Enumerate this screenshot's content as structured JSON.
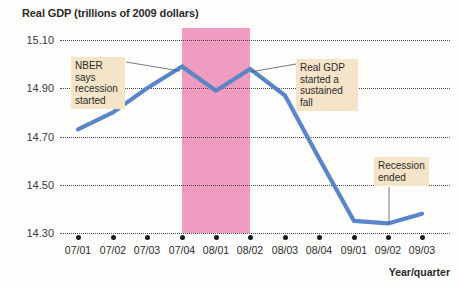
{
  "chart_data": {
    "type": "line",
    "title": "Real GDP (trillions of 2009 dollars)",
    "xlabel": "Year/quarter",
    "ylabel": "",
    "categories": [
      "07/01",
      "07/02",
      "07/03",
      "07/04",
      "08/01",
      "08/02",
      "08/03",
      "08/04",
      "09/01",
      "09/02",
      "09/03"
    ],
    "values": [
      14.73,
      14.8,
      14.9,
      14.99,
      14.89,
      14.98,
      14.87,
      14.61,
      14.35,
      14.34,
      14.38
    ],
    "series": [
      {
        "name": "Real GDP",
        "values": [
          14.73,
          14.8,
          14.9,
          14.99,
          14.89,
          14.98,
          14.87,
          14.61,
          14.35,
          14.34,
          14.38
        ]
      }
    ],
    "ylim": [
      14.3,
      15.1
    ],
    "yticks": [
      "15.10",
      "14.90",
      "14.70",
      "14.50",
      "14.30"
    ],
    "ytick_values": [
      15.1,
      14.9,
      14.7,
      14.5,
      14.3
    ],
    "grid": true,
    "legend": "none",
    "line_color": "#5a86c8",
    "shaded_region": {
      "label": "recession",
      "from": "07/04",
      "to": "08/02",
      "color": "#f09cc0"
    },
    "annotations": [
      {
        "id": "nber",
        "text": "NBER says recession started",
        "lines": [
          "NBER says",
          "recession",
          "started"
        ],
        "points_to": "07/04"
      },
      {
        "id": "sustained-fall",
        "text": "Real GDP started a sustained fall",
        "lines": [
          "Real GDP",
          "started a",
          "sustained fall"
        ],
        "points_to": "08/02"
      },
      {
        "id": "recession-ended",
        "text": "Recession ended",
        "lines": [
          "Recession",
          "ended"
        ],
        "points_to": "09/02"
      }
    ]
  },
  "axis": {
    "y_labels": [
      "15.10",
      "14.90",
      "14.70",
      "14.50",
      "14.30"
    ],
    "x_labels": [
      "07/01",
      "07/02",
      "07/03",
      "07/04",
      "08/01",
      "08/02",
      "08/03",
      "08/04",
      "09/01",
      "09/02",
      "09/03"
    ],
    "x_title": "Year/quarter"
  },
  "title": "Real GDP (trillions of 2009 dollars)",
  "callouts": {
    "nber": {
      "l1": "NBER says",
      "l2": "recession",
      "l3": "started"
    },
    "fall": {
      "l1": "Real GDP",
      "l2": "started a",
      "l3": "sustained fall"
    },
    "ended": {
      "l1": "Recession",
      "l2": "ended"
    }
  }
}
